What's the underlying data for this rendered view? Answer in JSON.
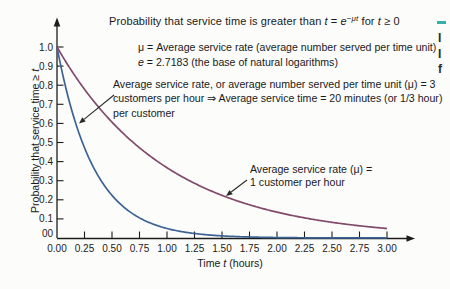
{
  "figure": {
    "title": {
      "prefix": "Probability that service time is greater than ",
      "t1": "t",
      "eq": " = ",
      "e_sym": "e",
      "sup": "−μt",
      "mid": " for ",
      "t2": "t",
      "suffix": " ≥ 0"
    },
    "notes": {
      "mu_line": "μ = Average service rate (average number served per time unit)",
      "e_sym": "e",
      "e_line_rest": " = 2.7183 (the base of natural logarithms)"
    },
    "mu3_annotation": {
      "line1": "Average service rate, or average number served per time unit (μ) = 3",
      "line2": "customers per hour ⇒ Average service time = 20 minutes (or 1/3 hour)",
      "line3": "per customer"
    },
    "mu1_annotation": {
      "line1": "Average service rate (μ) =",
      "line2": "1 customer per hour"
    },
    "axes": {
      "x_label": {
        "prefix": "Time ",
        "t": "t",
        "suffix": " (hours)"
      },
      "y_label": {
        "prefix": "Probability that service time ≥ ",
        "t": "t"
      },
      "x_tick_labels": [
        "0.00",
        "0.25",
        "0.50",
        "0.75",
        "1.00",
        "1.25",
        "1.50",
        "1.75",
        "2.00",
        "2.25",
        "2.50",
        "2.75",
        "3.00"
      ],
      "y_tick_labels": [
        "00",
        "0.1",
        "0.2",
        "0.3",
        "0.4",
        "0.5",
        "0.6",
        "0.7",
        "0.8",
        "0.9",
        "1.0"
      ]
    },
    "edge_fragments": {
      "teal_color": "#35b0ab",
      "letters": [
        "I",
        "I",
        "f"
      ]
    }
  },
  "chart_data": {
    "type": "line",
    "xlabel": "Time t (hours)",
    "ylabel": "Probability that service time ≥ t",
    "xlim": [
      0,
      3
    ],
    "ylim": [
      0,
      1
    ],
    "x_tick_step": 0.25,
    "y_tick_step": 0.1,
    "grid": false,
    "legend_position": "annotated-on-plot",
    "x": [
      0,
      0.25,
      0.5,
      0.75,
      1.0,
      1.25,
      1.5,
      1.75,
      2.0,
      2.25,
      2.5,
      2.75,
      3.0
    ],
    "series": [
      {
        "name": "μ = 3 customers per hour",
        "formula": "P = e^(−3t)",
        "mu": 3,
        "color": "#3d6395",
        "values": [
          1.0,
          0.472,
          0.223,
          0.105,
          0.05,
          0.024,
          0.011,
          0.005,
          0.002,
          0.001,
          0.001,
          0.0003,
          0.0001
        ]
      },
      {
        "name": "μ = 1 customer per hour",
        "formula": "P = e^(−t)",
        "mu": 1,
        "color": "#81496a",
        "values": [
          1.0,
          0.779,
          0.607,
          0.472,
          0.368,
          0.287,
          0.223,
          0.174,
          0.135,
          0.105,
          0.082,
          0.064,
          0.05
        ]
      }
    ]
  }
}
